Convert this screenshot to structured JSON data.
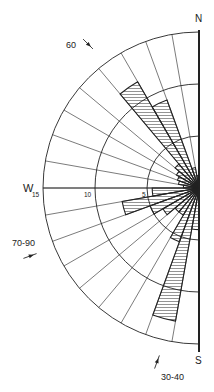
{
  "diagram": {
    "type": "rose-diagram",
    "orientation": "half-circle, west side",
    "center": {
      "x": 199,
      "y": 188
    },
    "px_per_unit": 10.4,
    "max_value": 15,
    "sector_width_deg": 10,
    "compass_labels": {
      "north": "N",
      "west": "W",
      "south": "S"
    },
    "scale_labels": [
      {
        "value": 15,
        "text": "15"
      },
      {
        "value": 10,
        "text": "10"
      },
      {
        "value": 5,
        "text": "5"
      }
    ],
    "rings": [
      5,
      10,
      15
    ],
    "intermediate_ring_radii": [
      2.5,
      7.5,
      12.5
    ],
    "annotations": [
      {
        "text": "60",
        "x": 66,
        "y": 48,
        "symbol": "dip-arrow",
        "arrow_angle": 45
      },
      {
        "text": "70-90",
        "x": 12,
        "y": 246,
        "symbol": "dip-arrow",
        "arrow_angle": -20
      },
      {
        "text": "30-40",
        "x": 161,
        "y": 380,
        "symbol": "dip-arrow",
        "arrow_angle": -70
      }
    ],
    "petals": [
      {
        "from_deg": 350,
        "to_deg": 360,
        "value": 1.2
      },
      {
        "from_deg": 340,
        "to_deg": 350,
        "value": 2.0
      },
      {
        "from_deg": 330,
        "to_deg": 340,
        "value": 9.0
      },
      {
        "from_deg": 320,
        "to_deg": 330,
        "value": 11.8
      },
      {
        "from_deg": 310,
        "to_deg": 320,
        "value": 3.0
      },
      {
        "from_deg": 300,
        "to_deg": 310,
        "value": 2.5
      },
      {
        "from_deg": 290,
        "to_deg": 300,
        "value": 2.2
      },
      {
        "from_deg": 280,
        "to_deg": 290,
        "value": 2.0
      },
      {
        "from_deg": 270,
        "to_deg": 280,
        "value": 1.5
      },
      {
        "from_deg": 260,
        "to_deg": 270,
        "value": 4.5
      },
      {
        "from_deg": 250,
        "to_deg": 260,
        "value": 7.5
      },
      {
        "from_deg": 240,
        "to_deg": 250,
        "value": 5.0
      },
      {
        "from_deg": 230,
        "to_deg": 240,
        "value": 4.0
      },
      {
        "from_deg": 220,
        "to_deg": 230,
        "value": 3.0
      },
      {
        "from_deg": 210,
        "to_deg": 220,
        "value": 3.0
      },
      {
        "from_deg": 200,
        "to_deg": 210,
        "value": 5.5
      },
      {
        "from_deg": 190,
        "to_deg": 200,
        "value": 13.0
      },
      {
        "from_deg": 180,
        "to_deg": 190,
        "value": 4.0
      }
    ],
    "colors": {
      "line": "#222222",
      "hatch": "#555555",
      "background": "#ffffff"
    }
  }
}
